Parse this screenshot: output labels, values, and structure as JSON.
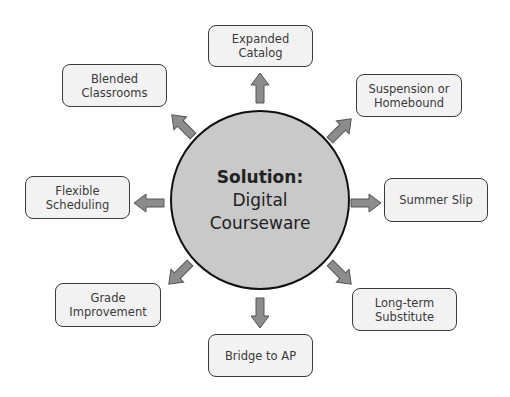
{
  "center": {
    "title": "Solution:",
    "line1": "Digital",
    "line2": "Courseware"
  },
  "nodes": [
    {
      "id": "expanded-catalog",
      "label": "Expanded Catalog"
    },
    {
      "id": "suspension-homebound",
      "label": "Suspension or Homebound"
    },
    {
      "id": "summer-slip",
      "label": "Summer Slip"
    },
    {
      "id": "long-term-substitute",
      "label": "Long-term Substitute"
    },
    {
      "id": "bridge-to-ap",
      "label": "Bridge to AP"
    },
    {
      "id": "grade-improvement",
      "label": "Grade Improvement"
    },
    {
      "id": "flexible-scheduling",
      "label": "Flexible Scheduling"
    },
    {
      "id": "blended-classrooms",
      "label": "Blended Classrooms"
    }
  ],
  "colors": {
    "circle_fill": "#c9c9c9",
    "box_fill": "#f2f2f2",
    "arrow_fill": "#8c8c8c",
    "outline": "#3a3a3a"
  }
}
